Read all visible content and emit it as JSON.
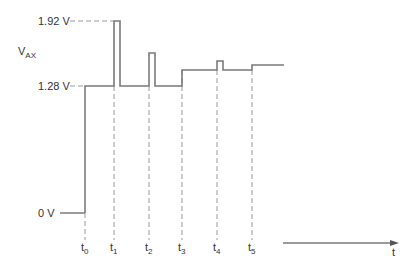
{
  "diagram": {
    "type": "voltage-timing-waveform",
    "y_axis_label": "V",
    "y_axis_label_sub": "AX",
    "x_axis_label": "t",
    "levels": [
      {
        "label": "1.92 V",
        "value": 1.92
      },
      {
        "label": "1.28 V",
        "value": 1.28
      },
      {
        "label": "0 V",
        "value": 0
      }
    ],
    "time_markers": [
      {
        "base": "t",
        "sub": "0"
      },
      {
        "base": "t",
        "sub": "1"
      },
      {
        "base": "t",
        "sub": "2"
      },
      {
        "base": "t",
        "sub": "3"
      },
      {
        "base": "t",
        "sub": "4"
      },
      {
        "base": "t",
        "sub": "5"
      }
    ],
    "events": [
      {
        "at": "t0",
        "description": "step from 0 V to 1.28 V"
      },
      {
        "at": "t1",
        "description": "spike to 1.92 V, returns to 1.28 V"
      },
      {
        "at": "t2",
        "description": "smaller spike, returns to 1.28 V"
      },
      {
        "at": "t3",
        "description": "step up to higher level"
      },
      {
        "at": "t4",
        "description": "small spike, returns to level"
      },
      {
        "at": "t5",
        "description": "small step up, holds"
      }
    ],
    "colors": {
      "trace": "#7a7a7a",
      "dashed": "#9a9a9a",
      "text": "#333333"
    }
  }
}
